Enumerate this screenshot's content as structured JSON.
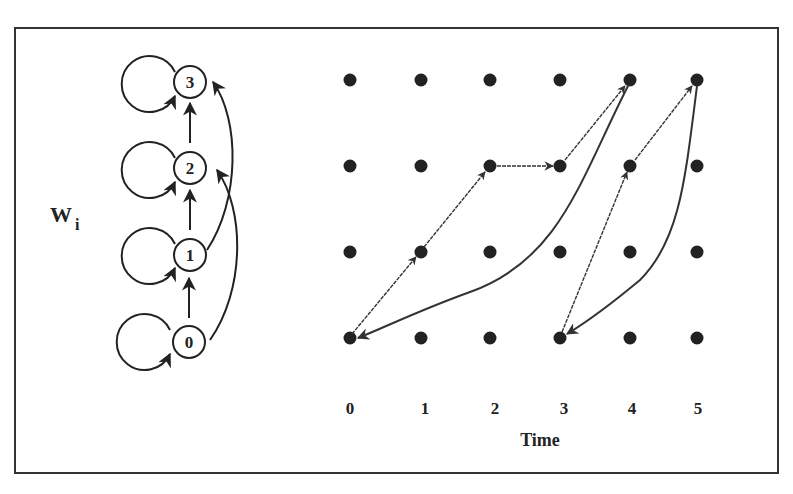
{
  "figure": {
    "state_diagram": {
      "label_main": "W",
      "label_sub": "i",
      "states": [
        "0",
        "1",
        "2",
        "3"
      ]
    },
    "grid": {
      "time_ticks": [
        "0",
        "1",
        "2",
        "3",
        "4",
        "5"
      ],
      "xlabel": "Time",
      "levels": 4
    }
  }
}
